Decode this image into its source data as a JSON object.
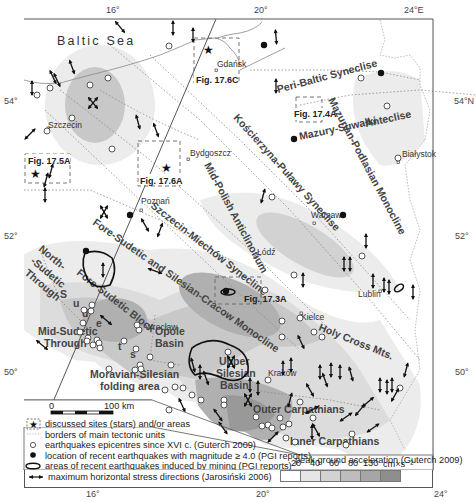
{
  "map": {
    "sea_label": "Baltic Sea",
    "coords": {
      "top": [
        "16°",
        "20°",
        "24°E"
      ],
      "bottom": [
        "16°",
        "20°",
        "24°"
      ],
      "left": [
        "54°",
        "52°",
        "50°"
      ],
      "right": [
        "54°N",
        "52°",
        "50°"
      ]
    },
    "cities": [
      {
        "name": "Gdańsk"
      },
      {
        "name": "Szczecin"
      },
      {
        "name": "Bydgoszcz"
      },
      {
        "name": "Poznań"
      },
      {
        "name": "Białystok"
      },
      {
        "name": "Warsaw"
      },
      {
        "name": "Łódź"
      },
      {
        "name": "Lublin"
      },
      {
        "name": "Wrocław"
      },
      {
        "name": "Kielce"
      },
      {
        "name": "Kraków"
      }
    ],
    "figure_boxes": [
      {
        "label": "Fig. 17.6C"
      },
      {
        "label": "Fig. 17.4A"
      },
      {
        "label": "Fig. 17.5A"
      },
      {
        "label": "Fig. 17.6A"
      },
      {
        "label": "Fig. 17.3A"
      }
    ],
    "tectonic_units": [
      {
        "name": "Peri-Baltic Syneclise"
      },
      {
        "name": "Mazurian-Podlasian Monocline"
      },
      {
        "name": "Mazury-Suwałki"
      },
      {
        "name": "Anteclise"
      },
      {
        "name": "Kościerzyna-Puławy Syneclise"
      },
      {
        "name": "Mid-Polish Anticlinorium"
      },
      {
        "name": "Szczecin-Miechów Synecline"
      },
      {
        "name": "Fore-Sudetic and Silesian-Cracow Monocline"
      },
      {
        "name": "North-"
      },
      {
        "name": "-Sudetic"
      },
      {
        "name": "Through"
      },
      {
        "name": "Fore-Sudetic Block"
      },
      {
        "name": "S"
      },
      {
        "name": "u"
      },
      {
        "name": "d"
      },
      {
        "name": "e"
      },
      {
        "name": "t"
      },
      {
        "name": "s"
      },
      {
        "name": "Mid-Sudetic"
      },
      {
        "name": "Through"
      },
      {
        "name": "Opole"
      },
      {
        "name": "Basin"
      },
      {
        "name": "Moravian-Silesian"
      },
      {
        "name": "folding area"
      },
      {
        "name": "Upper"
      },
      {
        "name": "Silesian"
      },
      {
        "name": "Basin"
      },
      {
        "name": "Holy Cross Mts."
      },
      {
        "name": "Outer Carpathians"
      },
      {
        "name": "Inner Carpathians"
      }
    ],
    "scale_bar": {
      "start": "0",
      "end": "100 km"
    }
  },
  "legend": {
    "items": [
      {
        "icon": "star-box-icon",
        "label": "discussed sites (stars) and/or areas"
      },
      {
        "icon": "dotted-line-icon",
        "label": "borders of main tectonic units"
      },
      {
        "icon": "open-circle-icon",
        "label": "earthquakes epicentres since XVI c. (Guterch 2009)"
      },
      {
        "icon": "filled-circle-icon",
        "label": "location of recent earthquakes with magnitude ≥ 4.0 (PGI reports)"
      },
      {
        "icon": "outline-oval-icon",
        "label": "areas of recent earthquakes induced by mining (PGI reports)"
      },
      {
        "icon": "stress-arrow-icon",
        "label": "maximum horizontal stress directions (Jarosiński 2006)"
      }
    ],
    "pga": {
      "title": "peak ground acceleration (Guterch 2009)",
      "ticks": [
        "20",
        "40",
        "60",
        "80",
        "130"
      ],
      "unit": "cm×s⁻²",
      "colors": [
        "#ffffff",
        "#e6e6e6",
        "#d2d2d2",
        "#bdbdbd",
        "#a6a6a6",
        "#8e8e8e"
      ]
    }
  },
  "colors": {
    "pga1": "#ececec",
    "pga2": "#dcdcdc",
    "pga3": "#c8c8c8",
    "pga4": "#b0b0b0",
    "pga5": "#999999",
    "frame": "#555555",
    "border_line": "#888888"
  }
}
